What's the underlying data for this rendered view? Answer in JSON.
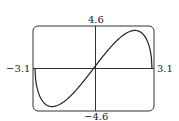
{
  "chart_data": {
    "type": "line",
    "title": "",
    "xlabel": "",
    "ylabel": "",
    "xlim": [
      -3.1,
      3.1
    ],
    "ylim": [
      -4.6,
      4.6
    ],
    "grid": false,
    "legend": null,
    "labels": {
      "xmin": "−3.1",
      "xmax": "3.1",
      "ymax": "4.6",
      "ymin": "−4.6"
    },
    "series": [
      {
        "name": "curve",
        "x": [
          -3.1,
          -3.0,
          -2.8,
          -2.5,
          -2.19,
          -1.8,
          -1.5,
          -1.0,
          -0.5,
          0,
          0.5,
          1.0,
          1.5,
          1.8,
          2.19,
          2.5,
          2.8,
          3.0,
          3.1
        ],
        "y": [
          0,
          -2.34,
          -3.72,
          -4.58,
          -4.8,
          -4.55,
          -4.07,
          -2.93,
          -1.53,
          0,
          1.53,
          2.93,
          4.07,
          4.55,
          4.8,
          4.58,
          3.72,
          2.34,
          0
        ]
      }
    ]
  }
}
